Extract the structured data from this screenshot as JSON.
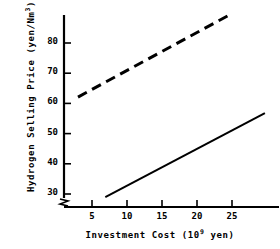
{
  "chart_data": {
    "type": "line",
    "title": "",
    "xlabel": "Investment Cost (10^9 yen)",
    "xlabel_main": "Investment Cost (10",
    "xlabel_exp": "9",
    "xlabel_tail": " yen)",
    "ylabel": "Hydrogen Selling Price (yen/Nm^3)",
    "ylabel_main": "Hydrogen Selling Price (yen/Nm",
    "ylabel_exp": "3",
    "ylabel_tail": ")",
    "xlim": [
      0,
      31.9
    ],
    "ylim": [
      26.5,
      89.3
    ],
    "xticks": [
      5,
      10,
      15,
      20,
      25
    ],
    "yticks": [
      30,
      40,
      50,
      60,
      70,
      80
    ],
    "xtick_labels": [
      "5",
      "10",
      "15",
      "20",
      "25"
    ],
    "ytick_labels": [
      "30",
      "40",
      "50",
      "60",
      "70",
      "80"
    ],
    "grid": false,
    "legend": "none",
    "y_axis_break": true,
    "axis_color": "#000000",
    "series": [
      {
        "name": "upper-dashed-case",
        "style": "dashed",
        "color": "#000000",
        "x": [
          3.0,
          24.4
        ],
        "y": [
          62.1,
          89.0
        ]
      },
      {
        "name": "lower-solid-case",
        "style": "solid",
        "color": "#000000",
        "x": [
          6.9,
          29.7
        ],
        "y": [
          29.0,
          56.8
        ]
      }
    ]
  }
}
